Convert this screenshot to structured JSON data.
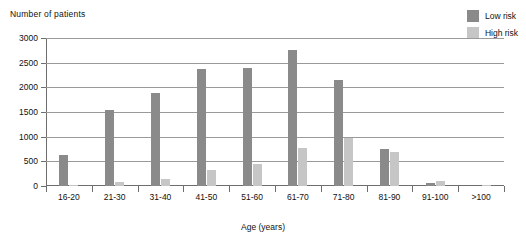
{
  "chart_data": {
    "type": "bar",
    "title": "",
    "ylabel": "Number of patients",
    "xlabel": "Age (years)",
    "categories": [
      "16-20",
      "21-30",
      "31-40",
      "41-50",
      "51-60",
      "61-70",
      "71-80",
      "81-90",
      "91-100",
      ">100"
    ],
    "series": [
      {
        "name": "Low risk",
        "color": "#8a8a8a",
        "values": [
          630,
          1550,
          1880,
          2380,
          2400,
          2750,
          2150,
          760,
          70,
          0
        ]
      },
      {
        "name": "High risk",
        "color": "#c6c6c6",
        "values": [
          30,
          90,
          150,
          320,
          450,
          780,
          980,
          690,
          110,
          30
        ]
      }
    ],
    "ylim": [
      0,
      3000
    ],
    "yticks": [
      0,
      500,
      1000,
      1500,
      2000,
      2500,
      3000
    ],
    "ytick_labels": [
      "0",
      "500",
      "1000",
      "1500",
      "2000",
      "2500",
      "3000"
    ],
    "grid": true,
    "legend_position": "top-right"
  },
  "colors": {
    "low_risk": "#8a8a8a",
    "high_risk": "#c6c6c6",
    "gridline": "#9a9a9a",
    "axis": "#6e6e6e",
    "text": "#111111",
    "background": "#ffffff"
  }
}
